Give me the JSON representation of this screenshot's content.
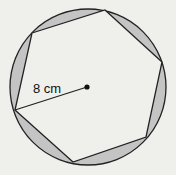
{
  "diagram": {
    "shape": "circle-with-inscribed-hexagon",
    "radius_label": "8 cm",
    "colors": {
      "background": "#efefec",
      "segment_fill": "#c4c4c4",
      "stroke": "#222222"
    }
  }
}
